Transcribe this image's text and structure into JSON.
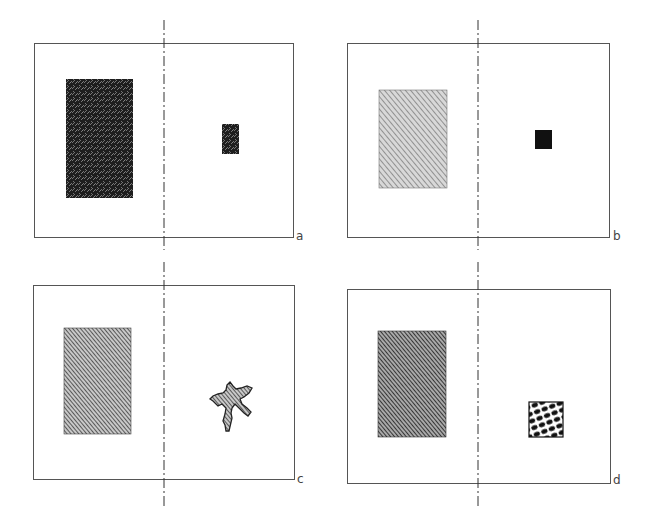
{
  "panels": [
    {
      "id": "a",
      "label": "a",
      "left_fill": "dense-speckle-dark",
      "right_object": "small-rectangle-speckle-dark"
    },
    {
      "id": "b",
      "label": "b",
      "left_fill": "light-hatch-gray",
      "right_object": "small-solid-black-square"
    },
    {
      "id": "c",
      "label": "c",
      "left_fill": "medium-diagonal-hatch",
      "right_object": "irregular-star-blob-hatched"
    },
    {
      "id": "d",
      "label": "d",
      "left_fill": "medium-dark-diagonal-hatch",
      "right_object": "small-square-oval-cell-pattern"
    }
  ],
  "colors": {
    "border": "#555555",
    "dashed_line": "#333333",
    "solid_black": "#111111"
  }
}
